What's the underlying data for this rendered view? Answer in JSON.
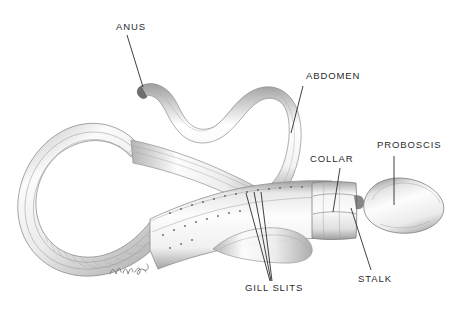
{
  "figure": {
    "background_color": "#ffffff",
    "ink_color": "#2b2b2b",
    "shading_color": "#9a9a9a",
    "width": 467,
    "height": 311
  },
  "labels": {
    "anus": "ANUS",
    "abdomen": "ABDOMEN",
    "collar": "COLLAR",
    "proboscis": "PROBOSCIS",
    "gill_slits": "GILL SLITS",
    "stalk": "STALK"
  },
  "signature": {
    "text": "Nina",
    "visible": true
  },
  "annotations": [
    {
      "id": "anus",
      "label": "ANUS",
      "text_x": 116,
      "text_y": 22,
      "leader": [
        [
          127,
          35
        ],
        [
          143,
          87
        ]
      ]
    },
    {
      "id": "abdomen",
      "label": "ABDOMEN",
      "text_x": 306,
      "text_y": 71,
      "leader": [
        [
          303,
          86
        ],
        [
          291,
          133
        ]
      ]
    },
    {
      "id": "collar",
      "label": "COLLAR",
      "text_x": 310,
      "text_y": 154,
      "leader": [
        [
          340,
          168
        ],
        [
          333,
          212
        ]
      ]
    },
    {
      "id": "proboscis",
      "label": "PROBOSCIS",
      "text_x": 377,
      "text_y": 140,
      "leader": [
        [
          394,
          156
        ],
        [
          394,
          205
        ]
      ]
    },
    {
      "id": "gill-slits",
      "label": "GILL SLITS",
      "text_x": 245,
      "text_y": 283,
      "leader": [
        [
          246,
          193
        ],
        [
          270,
          281
        ]
      ]
    },
    {
      "id": "stalk",
      "label": "STALK",
      "text_x": 358,
      "text_y": 274,
      "leader": [
        [
          351,
          208
        ],
        [
          371,
          270
        ]
      ]
    }
  ]
}
